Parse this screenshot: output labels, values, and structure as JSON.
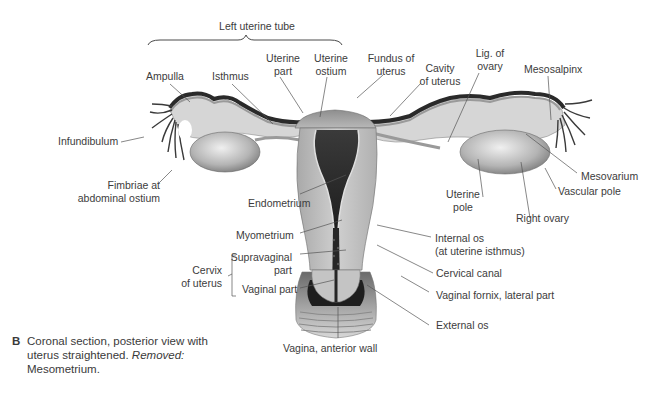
{
  "figure": {
    "title": "Left uterine tube",
    "caption": {
      "letter": "B",
      "text_before": "Coronal section, posterior view with uterus straightened.",
      "italic": "Removed:",
      "text_after": "Mesometrium."
    },
    "colors": {
      "text": "#3c3c3c",
      "leader_line": "#555555",
      "tissue_light": "#c8c8c8",
      "tissue_mid": "#9a9a9a",
      "tissue_dark": "#2e2e2e",
      "background": "#ffffff"
    }
  },
  "labels": {
    "ampulla": "Ampulla",
    "isthmus": "Isthmus",
    "uterine_part_1": "Uterine",
    "uterine_part_2": "part",
    "uterine_ostium_1": "Uterine",
    "uterine_ostium_2": "ostium",
    "fundus_1": "Fundus of",
    "fundus_2": "uterus",
    "cavity_1": "Cavity",
    "cavity_2": "of uterus",
    "lig_ovary_1": "Lig. of",
    "lig_ovary_2": "ovary",
    "mesosalpinx": "Mesosalpinx",
    "infundibulum": "Infundibulum",
    "fimbriae_1": "Fimbriae at",
    "fimbriae_2": "abdominal ostium",
    "endometrium": "Endometrium",
    "myometrium": "Myometrium",
    "cervix_1": "Cervix",
    "cervix_2": "of uterus",
    "supravaginal_1": "Supravaginal",
    "supravaginal_2": "part",
    "vaginal_part": "Vaginal part",
    "mesovarium": "Mesovarium",
    "vascular_pole": "Vascular pole",
    "uterine_pole_1": "Uterine",
    "uterine_pole_2": "pole",
    "right_ovary": "Right ovary",
    "internal_os_1": "Internal os",
    "internal_os_2": "(at uterine isthmus)",
    "cervical_canal": "Cervical canal",
    "vaginal_fornix": "Vaginal fornix, lateral part",
    "external_os": "External os",
    "vagina_wall": "Vagina, anterior wall"
  }
}
